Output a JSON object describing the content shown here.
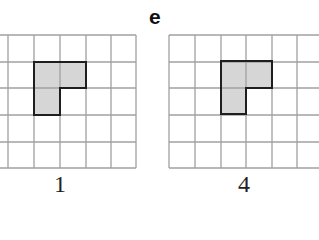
{
  "part_label": "e",
  "colors": {
    "grid_line": "#a0a0a0",
    "shape_fill": "#d6d6d6",
    "shape_outline": "#1e1e1e",
    "background": "#ffffff"
  },
  "grids": [
    {
      "caption": "1",
      "x_lines": [
        -18,
        8,
        34,
        60,
        86,
        111,
        136
      ],
      "y_lines": [
        35,
        62,
        88,
        115,
        142,
        168
      ],
      "shape_points": "34,62 86,62 86,88 60,88 60,115 34,115",
      "caption_x": 45
    },
    {
      "caption": "4",
      "x_lines": [
        169,
        195,
        221,
        246,
        272,
        297,
        323
      ],
      "y_lines": [
        35,
        62,
        88,
        115,
        142,
        168
      ],
      "shape_points": "221,61 272,61 272,88 246,88 246,114 221,114",
      "caption_x": 229
    }
  ]
}
